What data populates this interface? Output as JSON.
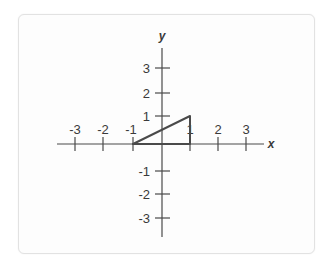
{
  "diagram": {
    "type": "coordinate-plane",
    "x_axis_label": "x",
    "y_axis_label": "y",
    "x_ticks": [
      "-3",
      "-2",
      "-1",
      "1",
      "2",
      "3"
    ],
    "y_ticks": [
      "3",
      "2",
      "1",
      "-1",
      "-2",
      "-3"
    ],
    "triangle": {
      "vertices": [
        [
          -1,
          0
        ],
        [
          1,
          0
        ],
        [
          1,
          1
        ]
      ],
      "stroke_color": "#4a4a4a"
    },
    "axis_color": "#4a4a4a"
  }
}
